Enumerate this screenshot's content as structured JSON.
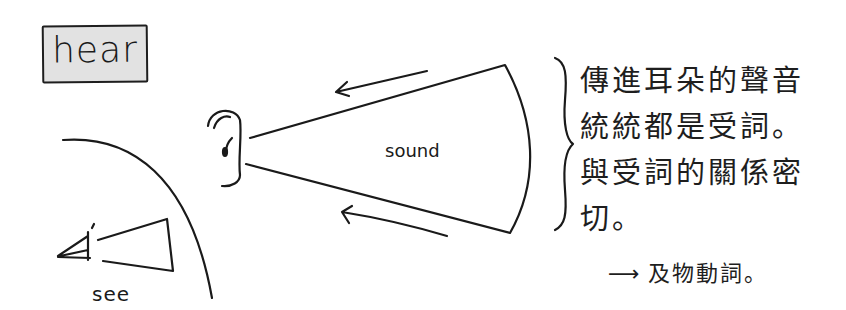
{
  "title_box": {
    "label": "hear"
  },
  "diagram": {
    "sound_label": "sound",
    "see_label": "see"
  },
  "note": {
    "lines": [
      "傳進耳朵的聲音",
      "統統都是受詞。",
      "與受詞的關係密",
      "切。"
    ]
  },
  "conclusion": {
    "arrow": "⟶",
    "text": "及物動詞。"
  },
  "colors": {
    "ink": "#1a1a1a",
    "box_fill": "#e2e2e2",
    "background": "#ffffff"
  }
}
